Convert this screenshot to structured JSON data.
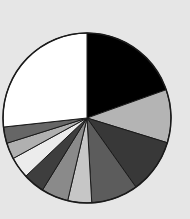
{
  "chart_data": {
    "type": "pie",
    "title": "",
    "start": "top",
    "direction": "clockwise",
    "legend": "none",
    "slices": [
      {
        "label": "",
        "value": 19.6,
        "color": "#000000"
      },
      {
        "label": "",
        "value": 10.1,
        "color": "#b4b4b4"
      },
      {
        "label": "",
        "value": 10.4,
        "color": "#383838"
      },
      {
        "label": "",
        "value": 9.0,
        "color": "#5c5c5c"
      },
      {
        "label": "",
        "value": 4.6,
        "color": "#c6c6c6"
      },
      {
        "label": "",
        "value": 5.2,
        "color": "#8a8a8a"
      },
      {
        "label": "",
        "value": 4.1,
        "color": "#3e3e3e"
      },
      {
        "label": "",
        "value": 4.1,
        "color": "#ececec"
      },
      {
        "label": "",
        "value": 3.1,
        "color": "#b0b0b0"
      },
      {
        "label": "",
        "value": 3.1,
        "color": "#666666"
      },
      {
        "label": "",
        "value": 26.7,
        "color": "#ffffff"
      }
    ]
  },
  "colors": {
    "background": "#e6e6e6",
    "outline": "#1a1a1a"
  }
}
